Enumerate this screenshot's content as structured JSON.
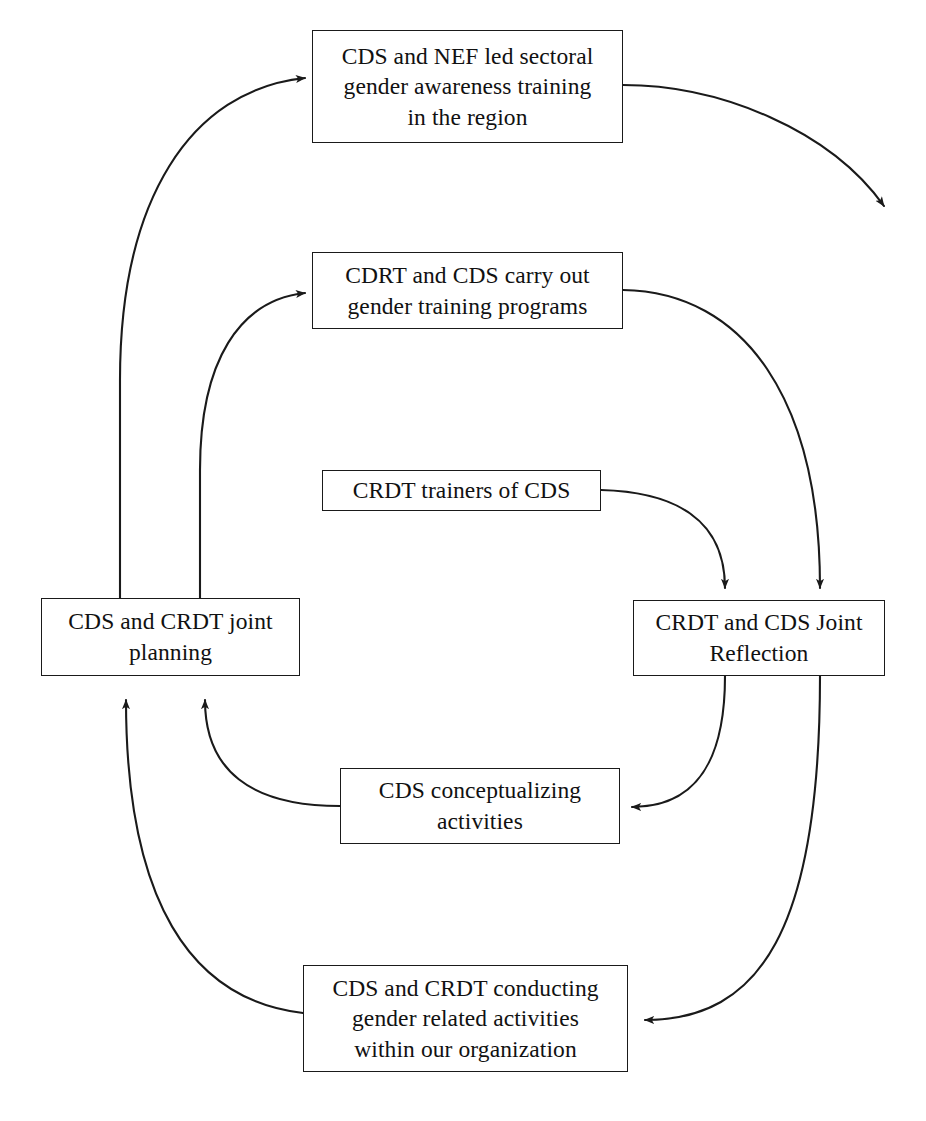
{
  "diagram": {
    "type": "cyclic-process-flow",
    "stroke_color": "#1a1a1a",
    "background_color": "#ffffff",
    "nodes": [
      {
        "id": "sectoral-training",
        "label": "CDS and NEF led sectoral\ngender awareness training\nin the region",
        "x": 312,
        "y": 30,
        "w": 311,
        "h": 113
      },
      {
        "id": "gender-training-programs",
        "label": "CDRT and CDS carry out\ngender training programs",
        "x": 312,
        "y": 252,
        "w": 311,
        "h": 77
      },
      {
        "id": "crdt-trainers",
        "label": "CRDT trainers of CDS",
        "x": 322,
        "y": 470,
        "w": 279,
        "h": 41
      },
      {
        "id": "joint-planning",
        "label": "CDS and CRDT joint\nplanning",
        "x": 41,
        "y": 598,
        "w": 259,
        "h": 78
      },
      {
        "id": "joint-reflection",
        "label": "CRDT and CDS Joint\nReflection",
        "x": 633,
        "y": 600,
        "w": 252,
        "h": 76
      },
      {
        "id": "conceptualizing",
        "label": "CDS conceptualizing\nactivities",
        "x": 340,
        "y": 768,
        "w": 280,
        "h": 76
      },
      {
        "id": "conducting-activities",
        "label": "CDS and CRDT conducting\ngender related activities\nwithin our organization",
        "x": 303,
        "y": 965,
        "w": 325,
        "h": 107
      }
    ],
    "edges": [
      {
        "id": "planning-to-sectoral-training",
        "from": "joint-planning",
        "to": "sectoral-training",
        "path": "M 120 598 L 120 380 C 120 200 190 90 305 78",
        "arrow": "end"
      },
      {
        "id": "planning-to-gender-training",
        "from": "joint-planning",
        "to": "gender-training-programs",
        "path": "M 200 598 L 200 470 C 200 360 240 300 305 293",
        "arrow": "end"
      },
      {
        "id": "sectoral-training-outflow",
        "from": "sectoral-training",
        "to": "external",
        "path": "M 623 85 C 720 85 830 130 884 206",
        "arrow": "end"
      },
      {
        "id": "gender-training-to-reflection",
        "from": "gender-training-programs",
        "to": "joint-reflection",
        "path": "M 623 290 C 745 292 820 400 820 588",
        "arrow": "end"
      },
      {
        "id": "trainers-to-reflection",
        "from": "crdt-trainers",
        "to": "joint-reflection",
        "path": "M 601 490 C 676 492 725 520 725 588",
        "arrow": "end"
      },
      {
        "id": "reflection-to-conceptualizing",
        "from": "joint-reflection",
        "to": "conceptualizing",
        "path": "M 725 676 C 725 770 690 807 632 807",
        "arrow": "end"
      },
      {
        "id": "reflection-to-conducting",
        "from": "joint-reflection",
        "to": "conducting-activities",
        "path": "M 820 676 C 820 930 760 1020 645 1020",
        "arrow": "end"
      },
      {
        "id": "conceptualizing-to-planning",
        "from": "conceptualizing",
        "to": "joint-planning",
        "path": "M 340 806 C 250 806 205 770 205 700",
        "arrow": "end"
      },
      {
        "id": "conducting-to-planning",
        "from": "conducting-activities",
        "to": "joint-planning",
        "path": "M 303 1013 C 190 1000 126 900 126 700",
        "arrow": "end"
      }
    ]
  }
}
